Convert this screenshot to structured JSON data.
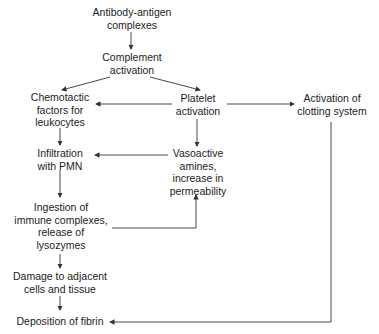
{
  "diagram": {
    "type": "flowchart",
    "nodes": {
      "antibody": "Antibody-antigen\ncomplexes",
      "complement": "Complement\nactivation",
      "chemotactic": "Chemotactic\nfactors for\nleukocytes",
      "platelet": "Platelet\nactivation",
      "clotting": "Activation of\nclotting system",
      "infiltration": "Infiltration\nwith PMN",
      "vasoactive": "Vasoactive\namines,\nincrease in\npermeability",
      "ingestion": "Ingestion of\nimmune complexes,\nrelease of\nlysozymes",
      "damage": "Damage to adjacent\ncells and tissue",
      "deposition": "Deposition of fibrin"
    },
    "edges": [
      {
        "from": "antibody",
        "to": "complement"
      },
      {
        "from": "complement",
        "to": "chemotactic"
      },
      {
        "from": "complement",
        "to": "platelet"
      },
      {
        "from": "platelet",
        "to": "chemotactic"
      },
      {
        "from": "platelet",
        "to": "clotting"
      },
      {
        "from": "platelet",
        "to": "vasoactive"
      },
      {
        "from": "chemotactic",
        "to": "infiltration"
      },
      {
        "from": "vasoactive",
        "to": "infiltration"
      },
      {
        "from": "infiltration",
        "to": "ingestion"
      },
      {
        "from": "ingestion",
        "to": "vasoactive"
      },
      {
        "from": "ingestion",
        "to": "damage"
      },
      {
        "from": "damage",
        "to": "deposition"
      },
      {
        "from": "clotting",
        "to": "deposition"
      }
    ]
  }
}
